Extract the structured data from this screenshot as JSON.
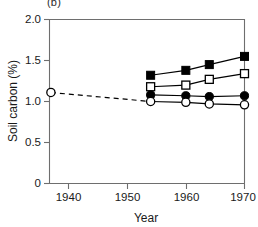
{
  "panel": {
    "label": "(b)"
  },
  "chart_data": {
    "type": "line",
    "title": "(b)",
    "xlabel": "Year",
    "ylabel": "Soil carbon (%)",
    "xlim": [
      1933,
      1971
    ],
    "ylim": [
      0,
      2.0
    ],
    "xticks": [
      1940,
      1950,
      1960,
      1970
    ],
    "xtick_labels": [
      "1940",
      "1950",
      "1960",
      "1970"
    ],
    "yticks": [
      0,
      0.5,
      1.0,
      1.5,
      2.0
    ],
    "ytick_labels": [
      "0",
      "0.5",
      "1.0",
      "1.5",
      "2.0"
    ],
    "grid": false,
    "legend": "none",
    "baseline": {
      "name": "baseline-open-circle",
      "marker": "open-circle",
      "linestyle": "dashed",
      "x": [
        1937,
        1954
      ],
      "y": [
        1.11,
        1.0
      ]
    },
    "series": [
      {
        "name": "filled-square",
        "marker": "filled-square",
        "linestyle": "solid",
        "x": [
          1954,
          1960,
          1964,
          1970
        ],
        "y": [
          1.32,
          1.38,
          1.45,
          1.55
        ]
      },
      {
        "name": "open-square",
        "marker": "open-square",
        "linestyle": "solid",
        "x": [
          1954,
          1960,
          1964,
          1970
        ],
        "y": [
          1.18,
          1.2,
          1.27,
          1.34
        ]
      },
      {
        "name": "filled-circle",
        "marker": "filled-circle",
        "linestyle": "solid",
        "x": [
          1954,
          1960,
          1964,
          1970
        ],
        "y": [
          1.08,
          1.07,
          1.06,
          1.07
        ]
      },
      {
        "name": "open-circle",
        "marker": "open-circle",
        "linestyle": "solid",
        "x": [
          1954,
          1960,
          1964,
          1970
        ],
        "y": [
          1.0,
          0.99,
          0.97,
          0.96
        ]
      }
    ]
  }
}
